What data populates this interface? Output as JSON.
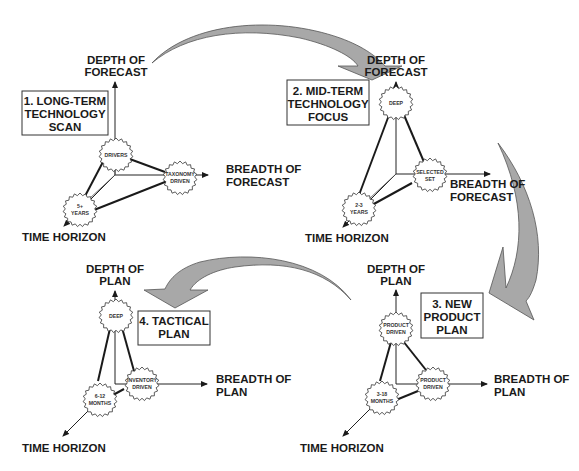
{
  "diagram": {
    "colors": {
      "arrow_fill": "#a8a8a8",
      "line": "#1a1a1a",
      "background": "#ffffff"
    },
    "panels": [
      {
        "step_label": [
          "1. LONG-TERM",
          "TECHNOLOGY",
          "SCAN"
        ],
        "axis_depth": [
          "DEPTH OF",
          "FORECAST"
        ],
        "axis_breadth": [
          "BREADTH OF",
          "FORECAST"
        ],
        "axis_time": "TIME HORIZON",
        "node_depth": [
          "DRIVERS"
        ],
        "node_breadth": [
          "TAXONOMY",
          "DRIVEN"
        ],
        "node_time": [
          "5+",
          "YEARS"
        ]
      },
      {
        "step_label": [
          "2. MID-TERM",
          "TECHNOLOGY",
          "FOCUS"
        ],
        "axis_depth": [
          "DEPTH OF",
          "FORECAST"
        ],
        "axis_breadth": [
          "BREADTH OF",
          "FORECAST"
        ],
        "axis_time": "TIME HORIZON",
        "node_depth": [
          "DEEP"
        ],
        "node_breadth": [
          "SELECTED",
          "SET"
        ],
        "node_time": [
          "2-3",
          "YEARS"
        ]
      },
      {
        "step_label": [
          "3. NEW",
          "PRODUCT",
          "PLAN"
        ],
        "axis_depth": [
          "DEPTH OF",
          "PLAN"
        ],
        "axis_breadth": [
          "BREADTH OF",
          "PLAN"
        ],
        "axis_time": "TIME HORIZON",
        "node_depth": [
          "PRODUCT",
          "DRIVEN"
        ],
        "node_breadth": [
          "PRODUCT",
          "DRIVEN"
        ],
        "node_time": [
          "3-18",
          "MONTHS"
        ]
      },
      {
        "step_label": [
          "4. TACTICAL",
          "PLAN"
        ],
        "axis_depth": [
          "DEPTH OF",
          "PLAN"
        ],
        "axis_breadth": [
          "BREADTH OF",
          "PLAN"
        ],
        "axis_time": "TIME HORIZON",
        "node_depth": [
          "DEEP"
        ],
        "node_breadth": [
          "INVENTORY",
          "DRIVEN"
        ],
        "node_time": [
          "6-12",
          "MONTHS"
        ]
      }
    ],
    "flow": [
      "1 → 2",
      "2 → 3",
      "3 → 4"
    ]
  }
}
